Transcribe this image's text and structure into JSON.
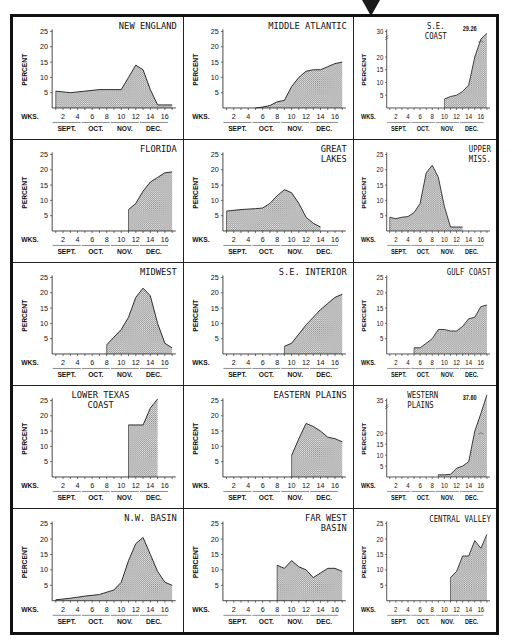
{
  "labels": {
    "ylabel": "PERCENT",
    "wks": "WKS.",
    "week_ticks": [
      "2",
      "4",
      "6",
      "8",
      "10",
      "12",
      "14",
      "16"
    ],
    "months": [
      "SEPT.",
      "OCT.",
      "NOV.",
      "DEC."
    ]
  },
  "colors": {
    "fill": "#b8b8b8",
    "line": "#222222",
    "frame": "#111111"
  },
  "chart_data": [
    {
      "type": "area",
      "title": "NEW ENGLAND",
      "ylabel": "PERCENT",
      "xlabel": "WKS.",
      "ylim": [
        0,
        25
      ],
      "yticks": [
        5,
        10,
        15,
        20,
        25
      ],
      "x": [
        1,
        3,
        5,
        7,
        9,
        10,
        11,
        12,
        13,
        14,
        15,
        16,
        17
      ],
      "values": [
        5.5,
        5,
        5.5,
        6,
        6,
        6,
        10,
        14,
        12.5,
        6,
        1,
        1,
        1
      ]
    },
    {
      "type": "area",
      "title": "MIDDLE ATLANTIC",
      "ylabel": "PERCENT",
      "xlabel": "WKS.",
      "ylim": [
        0,
        25
      ],
      "yticks": [
        5,
        10,
        15,
        20,
        25
      ],
      "x": [
        5,
        6,
        7,
        8,
        9,
        10,
        11,
        12,
        13,
        14,
        15,
        16,
        17
      ],
      "values": [
        0,
        0.3,
        0.8,
        2,
        2.5,
        7,
        10,
        12,
        12.5,
        12.5,
        13.5,
        14.5,
        15
      ]
    },
    {
      "type": "area",
      "title": "S.E. COAST",
      "ylabel": "PERCENT",
      "xlabel": "WKS.",
      "ylim": [
        0,
        30
      ],
      "yticks": [
        5,
        10,
        15,
        20,
        30
      ],
      "x": [
        10,
        11,
        12,
        13,
        14,
        15,
        16,
        17
      ],
      "values": [
        3.5,
        4.5,
        5,
        6.5,
        9,
        20,
        27,
        29.26
      ],
      "annotation": "29.26"
    },
    {
      "type": "area",
      "title": "FLORIDA",
      "ylabel": "PERCENT",
      "xlabel": "WKS.",
      "ylim": [
        0,
        25
      ],
      "yticks": [
        5,
        10,
        15,
        20,
        25
      ],
      "x": [
        11,
        12,
        13,
        14,
        15,
        16,
        17
      ],
      "values": [
        7,
        9,
        13,
        16,
        17.5,
        19,
        19.3
      ]
    },
    {
      "type": "area",
      "title": "GREAT LAKES",
      "ylabel": "PERCENT",
      "xlabel": "WKS.",
      "ylim": [
        0,
        25
      ],
      "yticks": [
        5,
        10,
        15,
        20,
        25
      ],
      "x": [
        1,
        3,
        5,
        6,
        7,
        8,
        9,
        10,
        11,
        12,
        13,
        14
      ],
      "values": [
        6.5,
        7,
        7.3,
        7.5,
        9,
        11.5,
        13.5,
        12.5,
        9,
        4.5,
        2.5,
        1.3
      ]
    },
    {
      "type": "area",
      "title": "UPPER MISS.",
      "ylabel": "PERCENT",
      "xlabel": "WKS.",
      "ylim": [
        0,
        25
      ],
      "yticks": [
        5,
        10,
        15,
        20,
        25
      ],
      "x": [
        1,
        2,
        3,
        4,
        5,
        6,
        7,
        8,
        9,
        10,
        11,
        12,
        13
      ],
      "values": [
        4.5,
        4,
        4.5,
        4.7,
        6,
        9,
        19,
        21.5,
        17.5,
        8,
        1.3,
        1.3,
        1.3
      ]
    },
    {
      "type": "area",
      "title": "MIDWEST",
      "ylabel": "PERCENT",
      "xlabel": "WKS.",
      "ylim": [
        0,
        25
      ],
      "yticks": [
        5,
        10,
        15,
        20,
        25
      ],
      "x": [
        8,
        9,
        10,
        11,
        12,
        13,
        14,
        15,
        16,
        17
      ],
      "values": [
        3,
        5.5,
        8,
        12,
        18.5,
        21.5,
        19,
        10,
        3.5,
        2
      ]
    },
    {
      "type": "area",
      "title": "S.E. INTERIOR",
      "ylabel": "PERCENT",
      "xlabel": "WKS.",
      "ylim": [
        0,
        25
      ],
      "yticks": [
        5,
        10,
        15,
        20,
        25
      ],
      "x": [
        9,
        10,
        11,
        12,
        13,
        14,
        15,
        16,
        17
      ],
      "values": [
        2.5,
        3.5,
        6.5,
        9.5,
        12,
        14.5,
        16.5,
        18.5,
        19.5
      ]
    },
    {
      "type": "area",
      "title": "GULF COAST",
      "ylabel": "PERCENT",
      "xlabel": "WKS.",
      "ylim": [
        0,
        25
      ],
      "yticks": [
        5,
        10,
        15,
        20,
        25
      ],
      "x": [
        5,
        6,
        7,
        8,
        9,
        10,
        11,
        12,
        13,
        14,
        15,
        16,
        17
      ],
      "values": [
        2,
        2,
        3.5,
        5,
        8,
        8,
        7.5,
        7.5,
        9,
        11.5,
        12,
        15.5,
        16
      ]
    },
    {
      "type": "area",
      "title": "LOWER TEXAS COAST",
      "ylabel": "PERCENT",
      "xlabel": "WKS.",
      "ylim": [
        0,
        25
      ],
      "yticks": [
        5,
        10,
        15,
        20,
        25
      ],
      "x": [
        11,
        12,
        13,
        14,
        15
      ],
      "values": [
        17,
        17,
        17,
        22.5,
        25.5
      ]
    },
    {
      "type": "area",
      "title": "EASTERN PLAINS",
      "ylabel": "PERCENT",
      "xlabel": "WKS.",
      "ylim": [
        0,
        25
      ],
      "yticks": [
        5,
        10,
        15,
        20,
        25
      ],
      "x": [
        10,
        11,
        12,
        13,
        14,
        15,
        16,
        17
      ],
      "values": [
        7,
        12.5,
        17.5,
        16.5,
        15,
        13,
        12.5,
        11.5
      ]
    },
    {
      "type": "area",
      "title": "WESTERN PLAINS",
      "ylabel": "PERCENT",
      "xlabel": "WKS.",
      "ylim": [
        0,
        35
      ],
      "yticks": [
        5,
        10,
        15,
        20,
        35
      ],
      "x": [
        9,
        10,
        11,
        12,
        13,
        14,
        15,
        16,
        17
      ],
      "values": [
        1,
        1,
        1.2,
        4,
        5,
        7,
        21,
        29,
        37.6
      ],
      "annotation": "37.60"
    },
    {
      "type": "area",
      "title": "N.W. BASIN",
      "ylabel": "PERCENT",
      "xlabel": "WKS.",
      "ylim": [
        0,
        25
      ],
      "yticks": [
        5,
        10,
        15,
        20,
        25
      ],
      "x": [
        1,
        3,
        5,
        7,
        9,
        10,
        11,
        12,
        13,
        14,
        15,
        16,
        17
      ],
      "values": [
        0.3,
        0.8,
        1.5,
        2,
        3.5,
        6,
        13,
        18.5,
        20.5,
        15,
        9.5,
        6,
        5
      ]
    },
    {
      "type": "area",
      "title": "FAR WEST BASIN",
      "ylabel": "PERCENT",
      "xlabel": "WKS.",
      "ylim": [
        0,
        25
      ],
      "yticks": [
        5,
        10,
        15,
        20,
        25
      ],
      "x": [
        8,
        9,
        10,
        11,
        12,
        13,
        14,
        15,
        16,
        17
      ],
      "values": [
        11.5,
        10.5,
        13,
        11,
        10,
        7.5,
        9,
        10.5,
        10.5,
        9.5
      ]
    },
    {
      "type": "area",
      "title": "CENTRAL VALLEY",
      "ylabel": "PERCENT",
      "xlabel": "WKS.",
      "ylim": [
        0,
        25
      ],
      "yticks": [
        5,
        10,
        15,
        20,
        25
      ],
      "x": [
        11,
        12,
        13,
        14,
        15,
        16,
        17
      ],
      "values": [
        7.5,
        9.5,
        14.5,
        14.5,
        19.5,
        17,
        21.5
      ]
    }
  ]
}
